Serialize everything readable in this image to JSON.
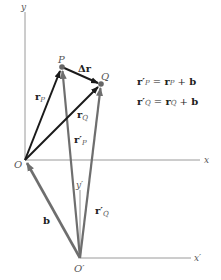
{
  "diagram": {
    "points": {
      "O": {
        "label": "O",
        "x": 25,
        "y": 160
      },
      "O_prime": {
        "label": "O′",
        "x": 80,
        "y": 258
      },
      "P": {
        "label": "P",
        "x": 62,
        "y": 67
      },
      "Q": {
        "label": "Q",
        "x": 101,
        "y": 84
      }
    },
    "axes": {
      "x": {
        "label": "x"
      },
      "y": {
        "label": "y"
      },
      "x_prime": {
        "label": "x′"
      },
      "y_prime": {
        "label": "y′"
      }
    },
    "vectors": {
      "r_P": {
        "main": "r",
        "sub": "P"
      },
      "r_Q": {
        "main": "r",
        "sub": "Q"
      },
      "r_prime_P": {
        "main": "r′",
        "sub": "P"
      },
      "r_prime_Q": {
        "main": "r′",
        "sub": "Q"
      },
      "delta_r": {
        "main": "Δr"
      },
      "b": {
        "main": "b"
      }
    },
    "equations": [
      {
        "lhs": "r′",
        "lhs_sub": "P",
        "eq": " = ",
        "r": "r",
        "r_sub": "P",
        "plus": " + ",
        "b": "b"
      },
      {
        "lhs": "r′",
        "lhs_sub": "Q",
        "eq": " = ",
        "r": "r",
        "r_sub": "Q",
        "plus": " + ",
        "b": "b"
      }
    ],
    "colors": {
      "black_vector": "#1a1a1a",
      "gray_vector": "#6e6e6e",
      "axis": "#9a9a9a"
    }
  }
}
